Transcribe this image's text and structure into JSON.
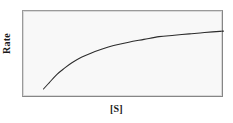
{
  "figure": {
    "background_color": "#ffffff",
    "plot_background_color": "#f8f8f8",
    "frame_color": "#8d8d8d",
    "curve_color": "#2b2b2b"
  },
  "chart_data": {
    "type": "line",
    "title": "",
    "subtitle": "",
    "xlabel": "[S]",
    "ylabel": "Rate",
    "grid": false,
    "legend": null,
    "legend_position": "none",
    "xticks": [],
    "yticks": [],
    "xticklabels": [],
    "yticklabels": [],
    "xlim": [
      0,
      100
    ],
    "ylim": [
      0,
      100
    ],
    "annotations": [],
    "series": [
      {
        "name": "Michaelis-Menten saturation curve",
        "x": [
          5,
          8,
          12,
          16,
          20,
          25,
          30,
          36,
          42,
          50,
          58,
          66,
          74,
          82,
          90,
          100
        ],
        "y": [
          8,
          17,
          29,
          38,
          46,
          54,
          60,
          66,
          71,
          76,
          80,
          84,
          86,
          88,
          90,
          92
        ]
      }
    ]
  }
}
